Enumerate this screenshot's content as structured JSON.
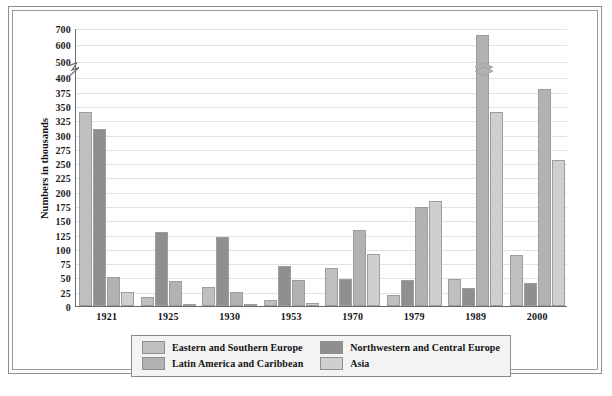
{
  "axis": {
    "y_title": "Numbers in thousands",
    "y_ticks": [
      "0",
      "25",
      "50",
      "75",
      "100",
      "125",
      "150",
      "175",
      "200",
      "225",
      "250",
      "275",
      "300",
      "325",
      "350",
      "375",
      "400",
      "500",
      "600",
      "700"
    ],
    "break_between": [
      "400",
      "500"
    ]
  },
  "legend": {
    "items": [
      {
        "label": "Eastern and Southern Europe",
        "color": "#bfbfbf",
        "key": "eastern-southern-europe"
      },
      {
        "label": "Northwestern and Central Europe",
        "color": "#8f8f8f",
        "key": "northwestern-central-europe"
      },
      {
        "label": "Latin America and Caribbean",
        "color": "#b2b2b2",
        "key": "latin-america-caribbean"
      },
      {
        "label": "Asia",
        "color": "#cfcfcf",
        "key": "asia"
      }
    ]
  },
  "chart_data": {
    "type": "bar",
    "title": "",
    "xlabel": "",
    "ylabel": "Numbers in thousands",
    "ylim": [
      0,
      700
    ],
    "grid": true,
    "legend_position": "bottom",
    "axis_break": {
      "from": 400,
      "to": 500,
      "note": "y-axis compressed between 400 and 500"
    },
    "categories": [
      "1921",
      "1925",
      "1930",
      "1953",
      "1970",
      "1979",
      "1989",
      "2000"
    ],
    "series": [
      {
        "name": "Eastern and Southern Europe",
        "color": "#bfbfbf",
        "values": [
          340,
          15,
          34,
          11,
          67,
          19,
          48,
          90
        ]
      },
      {
        "name": "Northwestern and Central Europe",
        "color": "#8f8f8f",
        "values": [
          310,
          130,
          120,
          70,
          47,
          45,
          31,
          40
        ]
      },
      {
        "name": "Latin America and Caribbean",
        "color": "#b2b2b2",
        "values": [
          50,
          43,
          25,
          45,
          133,
          174,
          655,
          380
        ]
      },
      {
        "name": "Asia",
        "color": "#cfcfcf",
        "values": [
          25,
          2,
          3,
          6,
          91,
          184,
          340,
          255
        ]
      }
    ],
    "broken_bars": [
      {
        "category": "1989",
        "series": "Latin America and Caribbean",
        "value": 655
      }
    ]
  }
}
